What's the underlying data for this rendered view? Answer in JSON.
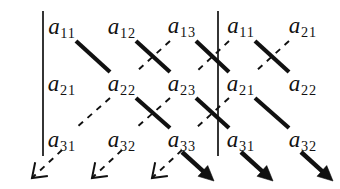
{
  "figure": {
    "ink_color": "#111111",
    "background_color": "#ffffff"
  },
  "matrix": {
    "rows": 3,
    "columns": 5,
    "entries": [
      {
        "id": "e-r1c1",
        "base": "a",
        "sub": "11",
        "row": 1,
        "col": 1,
        "x": 62,
        "y": 28
      },
      {
        "id": "e-r1c2",
        "base": "a",
        "sub": "12",
        "row": 1,
        "col": 2,
        "x": 122,
        "y": 28
      },
      {
        "id": "e-r1c3",
        "base": "a",
        "sub": "13",
        "row": 1,
        "col": 3,
        "x": 182,
        "y": 27
      },
      {
        "id": "e-r1c4",
        "base": "a",
        "sub": "11",
        "row": 1,
        "col": 4,
        "x": 241,
        "y": 27
      },
      {
        "id": "e-r1c5",
        "base": "a",
        "sub": "21",
        "row": 1,
        "col": 5,
        "x": 303,
        "y": 27
      },
      {
        "id": "e-r2c1",
        "base": "a",
        "sub": "21",
        "row": 2,
        "col": 1,
        "x": 62,
        "y": 85
      },
      {
        "id": "e-r2c2",
        "base": "a",
        "sub": "22",
        "row": 2,
        "col": 2,
        "x": 122,
        "y": 85
      },
      {
        "id": "e-r2c3",
        "base": "a",
        "sub": "23",
        "row": 2,
        "col": 3,
        "x": 182,
        "y": 85
      },
      {
        "id": "e-r2c4",
        "base": "a",
        "sub": "21",
        "row": 2,
        "col": 4,
        "x": 241,
        "y": 85
      },
      {
        "id": "e-r2c5",
        "base": "a",
        "sub": "22",
        "row": 2,
        "col": 5,
        "x": 303,
        "y": 85
      },
      {
        "id": "e-r3c1",
        "base": "a",
        "sub": "31",
        "row": 3,
        "col": 1,
        "x": 62,
        "y": 141
      },
      {
        "id": "e-r3c2",
        "base": "a",
        "sub": "32",
        "row": 3,
        "col": 2,
        "x": 122,
        "y": 141
      },
      {
        "id": "e-r3c3",
        "base": "a",
        "sub": "33",
        "row": 3,
        "col": 3,
        "x": 182,
        "y": 141
      },
      {
        "id": "e-r3c4",
        "base": "a",
        "sub": "31",
        "row": 3,
        "col": 4,
        "x": 241,
        "y": 141
      },
      {
        "id": "e-r3c5",
        "base": "a",
        "sub": "32",
        "row": 3,
        "col": 5,
        "x": 303,
        "y": 141
      }
    ]
  },
  "rules": {
    "determinant_bars": [
      {
        "id": "bar-left",
        "x": 43,
        "y1": 11,
        "y2": 156
      },
      {
        "id": "bar-right",
        "x": 218,
        "y1": 11,
        "y2": 156
      }
    ],
    "solid_diagonals": [
      {
        "id": "solid-1",
        "x1": 76,
        "y1": 41,
        "x2": 110,
        "y2": 72
      },
      {
        "id": "solid-2",
        "x1": 136,
        "y1": 41,
        "x2": 170,
        "y2": 72
      },
      {
        "id": "solid-3",
        "x1": 196,
        "y1": 41,
        "x2": 229,
        "y2": 72
      },
      {
        "id": "solid-4",
        "x1": 255,
        "y1": 41,
        "x2": 289,
        "y2": 72
      },
      {
        "id": "solid-5",
        "x1": 136,
        "y1": 98,
        "x2": 170,
        "y2": 128
      },
      {
        "id": "solid-6",
        "x1": 196,
        "y1": 98,
        "x2": 229,
        "y2": 128
      },
      {
        "id": "solid-7",
        "x1": 255,
        "y1": 98,
        "x2": 289,
        "y2": 128
      }
    ],
    "dashed_diagonals": [
      {
        "id": "dashed-1",
        "x1": 170,
        "y1": 41,
        "x2": 136,
        "y2": 72
      },
      {
        "id": "dashed-2",
        "x1": 229,
        "y1": 41,
        "x2": 196,
        "y2": 72
      },
      {
        "id": "dashed-3",
        "x1": 289,
        "y1": 41,
        "x2": 255,
        "y2": 72
      },
      {
        "id": "dashed-4",
        "x1": 110,
        "y1": 98,
        "x2": 76,
        "y2": 128
      },
      {
        "id": "dashed-5",
        "x1": 170,
        "y1": 98,
        "x2": 136,
        "y2": 128
      },
      {
        "id": "dashed-6",
        "x1": 229,
        "y1": 98,
        "x2": 196,
        "y2": 128
      }
    ],
    "dashed_arrows": [
      {
        "id": "arrow-neg-1",
        "x1": 62,
        "y1": 150,
        "x2": 32,
        "y2": 178,
        "sign": "negative"
      },
      {
        "id": "arrow-neg-2",
        "x1": 122,
        "y1": 150,
        "x2": 92,
        "y2": 178,
        "sign": "negative"
      },
      {
        "id": "arrow-neg-3",
        "x1": 182,
        "y1": 150,
        "x2": 152,
        "y2": 178,
        "sign": "negative"
      }
    ],
    "solid_arrows": [
      {
        "id": "arrow-pos-1",
        "x1": 182,
        "y1": 152,
        "x2": 214,
        "y2": 181,
        "sign": "positive"
      },
      {
        "id": "arrow-pos-2",
        "x1": 241,
        "y1": 152,
        "x2": 273,
        "y2": 181,
        "sign": "positive"
      },
      {
        "id": "arrow-pos-3",
        "x1": 301,
        "y1": 152,
        "x2": 333,
        "y2": 181,
        "sign": "positive"
      }
    ]
  },
  "chart_data": {
    "type": "diagram",
    "grid": [
      [
        "a11",
        "a12",
        "a13",
        "a11",
        "a21"
      ],
      [
        "a21",
        "a22",
        "a23",
        "a21",
        "a22"
      ],
      [
        "a31",
        "a32",
        "a33",
        "a31",
        "a32"
      ]
    ],
    "positive_products": [
      "a11 a22 a33",
      "a12 a23 a31",
      "a13 a21 a32"
    ],
    "negative_products": [
      "a13 a22 a31",
      "a11 a23 a32",
      "a12 a21 a33"
    ],
    "legend": {
      "solid": "down-right diagonal (positive product)",
      "dashed": "down-left diagonal (negative product)"
    }
  }
}
